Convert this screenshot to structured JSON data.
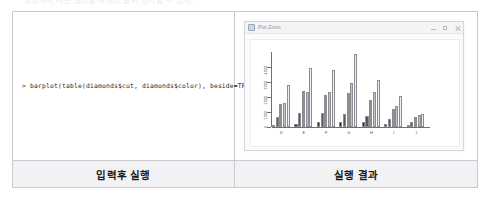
{
  "page": {
    "ghost_top_text": "과정에서 나온 결과를 아래와 같이 정리할 수 있다."
  },
  "table": {
    "left": {
      "footer_label": "입력후 실행",
      "console": {
        "prompt": ">",
        "command": "barplot(table(diamonds$cut, diamonds$color), beside=TRUE)",
        "full_line": "> barplot(table(diamonds$cut, diamonds$color), beside=TRUE)"
      }
    },
    "right": {
      "footer_label": "실행 결과"
    }
  },
  "plot_window": {
    "title": "Plot Zoom",
    "icon": "chart-window-icon",
    "controls": [
      {
        "name": "minimize-button",
        "glyph": "minimize"
      },
      {
        "name": "maximize-button",
        "glyph": "maximize"
      },
      {
        "name": "close-button",
        "glyph": "close"
      }
    ]
  },
  "chart_data": {
    "type": "bar",
    "title": "",
    "xlabel": "",
    "ylabel": "",
    "grid": false,
    "legend": false,
    "grouped": true,
    "bar_orientation": "vertical",
    "categories": [
      "D",
      "E",
      "F",
      "G",
      "H",
      "I",
      "J"
    ],
    "series": [
      {
        "name": "Fair",
        "color": "#1c1c1c",
        "values": [
          163,
          224,
          312,
          314,
          303,
          175,
          119
        ]
      },
      {
        "name": "Good",
        "color": "#595959",
        "values": [
          662,
          933,
          909,
          871,
          702,
          522,
          307
        ]
      },
      {
        "name": "Very Good",
        "color": "#8f8f8f",
        "values": [
          1513,
          2400,
          2164,
          2299,
          1824,
          1204,
          678
        ]
      },
      {
        "name": "Premium",
        "color": "#c2c2c2",
        "values": [
          1603,
          2337,
          2331,
          2924,
          2360,
          1428,
          808
        ]
      },
      {
        "name": "Ideal",
        "color": "#efefef",
        "values": [
          2834,
          3903,
          3826,
          4884,
          3115,
          2093,
          896
        ]
      }
    ],
    "ylim": [
      0,
      5000
    ],
    "yticks": [
      0,
      1000,
      2000,
      3000,
      4000
    ],
    "ytick_labels": [
      "0",
      "1000",
      "2000",
      "3000",
      "4000"
    ],
    "axis_color": "#6f6f75",
    "bar_border_color": "#8c8c92"
  }
}
